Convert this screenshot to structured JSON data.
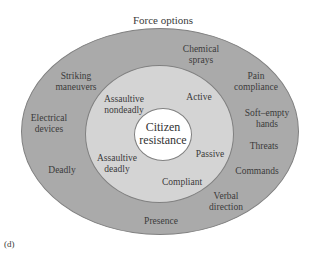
{
  "diagram": {
    "title": "Force options",
    "caption": "(d)",
    "colors": {
      "outer_ring": "#aaaaaa",
      "middle_ring": "#d4d4d4",
      "center": "#ffffff",
      "stroke": "#777777"
    },
    "center": {
      "line1": "Citizen",
      "line2": "resistance"
    },
    "resistance_levels": [
      {
        "line1": "Assaultive",
        "line2": "nondeadly"
      },
      {
        "line1": "Active",
        "line2": ""
      },
      {
        "line1": "Assaultive",
        "line2": "deadly"
      },
      {
        "line1": "Passive",
        "line2": ""
      },
      {
        "line1": "Compliant",
        "line2": ""
      }
    ],
    "force_options": [
      {
        "line1": "Chemical",
        "line2": "sprays"
      },
      {
        "line1": "Striking",
        "line2": "maneuvers"
      },
      {
        "line1": "Pain",
        "line2": "compliance"
      },
      {
        "line1": "Electrical",
        "line2": "devices"
      },
      {
        "line1": "Soft–empty",
        "line2": "hands"
      },
      {
        "line1": "Threats",
        "line2": ""
      },
      {
        "line1": "Deadly",
        "line2": ""
      },
      {
        "line1": "Commands",
        "line2": ""
      },
      {
        "line1": "Verbal",
        "line2": "direction"
      },
      {
        "line1": "Presence",
        "line2": ""
      }
    ]
  }
}
